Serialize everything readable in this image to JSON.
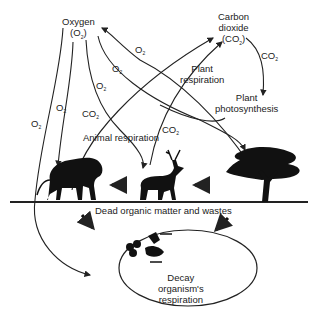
{
  "diagram": {
    "nodes": {
      "oxygen": {
        "line1": "Oxygen",
        "line2": "(O",
        "line2_end": ")",
        "sub": "2"
      },
      "co2": {
        "line1": "Carbon",
        "line2": "dioxide",
        "line3": "(CO",
        "line3_end": ")",
        "sub": "2"
      },
      "plant_photo": {
        "line1": "Plant",
        "line2": "photosynthesis"
      },
      "plant_resp": {
        "line1": "Plant",
        "line2": "respiration"
      },
      "animal_resp": {
        "label": "Animal respiration"
      },
      "dead_matter": {
        "label": "Dead organic matter and wastes"
      },
      "decay": {
        "line1": "Decay",
        "line2": "organism's",
        "line3": "respiration"
      }
    },
    "edge_labels": {
      "o2": "O",
      "co2": "CO",
      "sub": "2"
    },
    "icons": [
      "lion-silhouette",
      "deer-silhouette",
      "tree-silhouette",
      "decomposers-icon"
    ]
  }
}
